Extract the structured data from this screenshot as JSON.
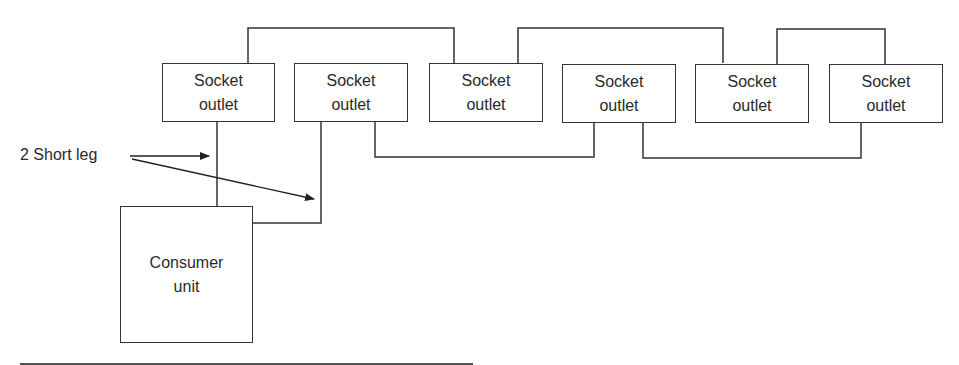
{
  "diagram": {
    "type": "ring-final-circuit",
    "stroke_color": "#333333",
    "background": "#ffffff",
    "socket_outlets": [
      {
        "id": "s1",
        "line1": "Socket",
        "line2": "outlet"
      },
      {
        "id": "s2",
        "line1": "Socket",
        "line2": "outlet"
      },
      {
        "id": "s3",
        "line1": "Socket",
        "line2": "outlet"
      },
      {
        "id": "s4",
        "line1": "Socket",
        "line2": "outlet"
      },
      {
        "id": "s5",
        "line1": "Socket",
        "line2": "outlet"
      },
      {
        "id": "s6",
        "line1": "Socket",
        "line2": "outlet"
      }
    ],
    "consumer_unit": {
      "line1": "Consumer",
      "line2": "unit"
    },
    "annotation": {
      "text": "2 Short leg",
      "arrow_count": 2
    },
    "connections": [
      {
        "from": "s1",
        "to": "s3",
        "route": "top"
      },
      {
        "from": "s3",
        "to": "s5",
        "route": "top"
      },
      {
        "from": "s5",
        "to": "s6",
        "route": "top"
      },
      {
        "from": "s2",
        "to": "s4",
        "route": "bottom"
      },
      {
        "from": "s4",
        "to": "s6",
        "route": "bottom"
      },
      {
        "from": "consumer_unit",
        "to": "s1",
        "route": "short-leg"
      },
      {
        "from": "consumer_unit",
        "to": "s2",
        "route": "short-leg"
      }
    ]
  }
}
